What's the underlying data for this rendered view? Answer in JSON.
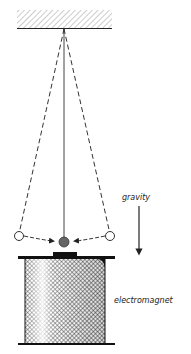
{
  "diagram": {
    "labels": {
      "gravity": "gravity",
      "electromagnet": "electromagnet"
    },
    "colors": {
      "line": "#222222",
      "hatch": "#888888",
      "bob": "#666666",
      "background": "#ffffff"
    },
    "elements": [
      "ceiling-support",
      "pendulum-string",
      "pendulum-bob",
      "swing-extreme-left",
      "swing-extreme-right",
      "swing-arc",
      "gravity-arrow",
      "electromagnet-coil"
    ]
  }
}
